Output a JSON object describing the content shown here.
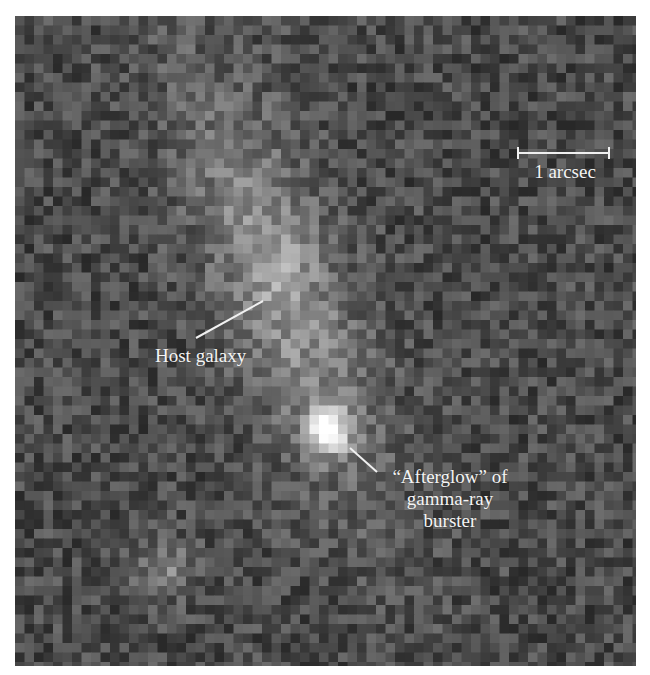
{
  "image": {
    "description": "Telescope image of a gamma-ray burst afterglow and its host galaxy",
    "background_color": "#4a4a4a"
  },
  "scale_bar": {
    "label": "1 arcsec"
  },
  "annotations": {
    "host_galaxy": "Host galaxy",
    "afterglow_line1": "“Afterglow” of",
    "afterglow_line2": "gamma-ray",
    "afterglow_line3": "burster"
  },
  "colors": {
    "label_text": "#f4f4f4",
    "leader_line": "#f0f0f0",
    "afterglow_core": "#ffffff"
  }
}
